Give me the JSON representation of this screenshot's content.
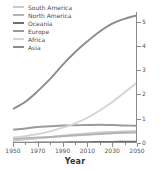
{
  "chart_data": {
    "type": "line",
    "title": "",
    "xlabel": "Year",
    "ylabel": "Population (billions)",
    "xlim": [
      1950,
      2050
    ],
    "ylim": [
      0,
      5.4
    ],
    "xticks": [
      1950,
      1970,
      1990,
      2010,
      2030,
      2050
    ],
    "yticks": [
      0,
      1,
      2,
      3,
      4,
      5
    ],
    "grid": false,
    "legend_position": "top-left",
    "y_axis_side": "right",
    "x": [
      1950,
      1960,
      1970,
      1980,
      1990,
      2000,
      2010,
      2020,
      2030,
      2040,
      2050
    ],
    "series": [
      {
        "name": "South America",
        "color": "#c9c9c9",
        "values": [
          0.11,
          0.15,
          0.19,
          0.24,
          0.3,
          0.35,
          0.39,
          0.43,
          0.46,
          0.48,
          0.49
        ]
      },
      {
        "name": "North America",
        "color": "#b4b4b4",
        "values": [
          0.17,
          0.2,
          0.23,
          0.25,
          0.28,
          0.31,
          0.34,
          0.37,
          0.4,
          0.42,
          0.43
        ]
      },
      {
        "name": "Oceania",
        "color": "#6e6e6e",
        "values": [
          0.013,
          0.016,
          0.019,
          0.023,
          0.027,
          0.031,
          0.037,
          0.043,
          0.048,
          0.053,
          0.057
        ]
      },
      {
        "name": "Europe",
        "color": "#9a9a9a",
        "values": [
          0.55,
          0.6,
          0.66,
          0.69,
          0.72,
          0.73,
          0.74,
          0.75,
          0.74,
          0.72,
          0.71
        ]
      },
      {
        "name": "Africa",
        "color": "#d4d4d4",
        "values": [
          0.23,
          0.28,
          0.37,
          0.48,
          0.63,
          0.81,
          1.04,
          1.34,
          1.69,
          2.08,
          2.49
        ]
      },
      {
        "name": "Asia",
        "color": "#8c8c8c",
        "values": [
          1.4,
          1.7,
          2.14,
          2.64,
          3.22,
          3.74,
          4.19,
          4.6,
          4.92,
          5.12,
          5.26
        ]
      }
    ]
  },
  "legend": {
    "items": [
      {
        "label": "South America"
      },
      {
        "label": "North America"
      },
      {
        "label": "Oceania"
      },
      {
        "label": "Europe"
      },
      {
        "label": "Africa"
      },
      {
        "label": "Asia"
      }
    ]
  }
}
